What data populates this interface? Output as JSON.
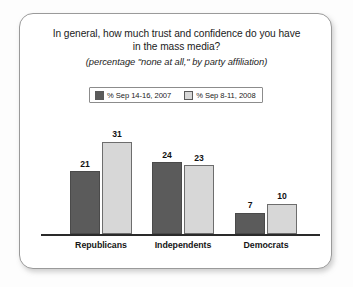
{
  "card": {
    "title_line_1": "In general, how much trust and confidence do you have",
    "title_line_2": "in the mass media?",
    "subtitle": "(percentage \"none at all,\" by party affiliation)"
  },
  "legend": {
    "items": [
      {
        "label": "% Sep 14-16, 2007",
        "color": "#5b5b5b"
      },
      {
        "label": "% Sep 8-11, 2008",
        "color": "#d7d7d7"
      }
    ]
  },
  "chart_data": {
    "type": "bar",
    "title": "In general, how much trust and confidence do you have in the mass media?",
    "subtitle": "(percentage \"none at all,\" by party affiliation)",
    "xlabel": "",
    "ylabel": "",
    "ylim": [
      0,
      35
    ],
    "grid": false,
    "legend_position": "top-center",
    "categories": [
      "Republicans",
      "Independents",
      "Democrats"
    ],
    "series": [
      {
        "name": "% Sep 14-16, 2007",
        "color": "#5b5b5b",
        "values": [
          21,
          24,
          7
        ]
      },
      {
        "name": "% Sep 8-11, 2008",
        "color": "#d7d7d7",
        "values": [
          31,
          23,
          10
        ]
      }
    ]
  }
}
